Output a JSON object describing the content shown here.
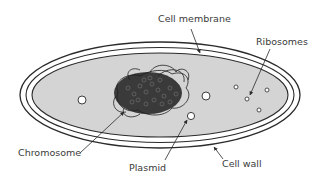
{
  "diagram": {
    "colors": {
      "cytoplasm": "#d4d4d4",
      "outline": "#2a2a2a",
      "chromosome": "#2b2b2b",
      "label_text": "#3a3a3a",
      "background": "#ffffff"
    },
    "labels": [
      {
        "id": "cell-membrane",
        "text": "Cell membrane"
      },
      {
        "id": "ribosomes",
        "text": "Ribosomes"
      },
      {
        "id": "chromosome",
        "text": "Chromosome"
      },
      {
        "id": "plasmid",
        "text": "Plasmid"
      },
      {
        "id": "cell-wall",
        "text": "Cell wall"
      }
    ]
  }
}
